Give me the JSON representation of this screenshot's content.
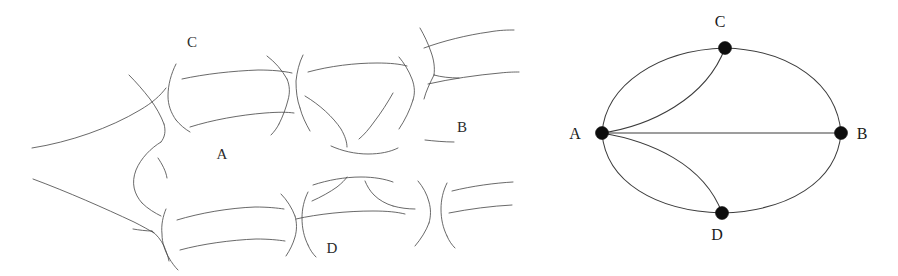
{
  "figure": {
    "background_color": "#ffffff",
    "ink_color": "#4a4a4a",
    "node_color": "#0d0d0d",
    "edge_color": "#3c3c3c"
  },
  "sketch_panel": {
    "name": "hand-drawn-map",
    "labels": [
      {
        "text": "C",
        "x": 192,
        "y": 47
      },
      {
        "text": "A",
        "x": 222,
        "y": 159
      },
      {
        "text": "B",
        "x": 462,
        "y": 132
      },
      {
        "text": "D",
        "x": 332,
        "y": 253
      }
    ]
  },
  "graph_panel": {
    "name": "planar-graph",
    "nodes": [
      {
        "id": "A",
        "cx": 82,
        "cy": 133,
        "r": 6.5,
        "label": "A",
        "label_x": 55,
        "label_y": 139
      },
      {
        "id": "B",
        "cx": 321,
        "cy": 133,
        "r": 6.5,
        "label": "B",
        "label_x": 342,
        "label_y": 139
      },
      {
        "id": "C",
        "cx": 205,
        "cy": 48,
        "r": 6.5,
        "label": "C",
        "label_x": 200,
        "label_y": 27
      },
      {
        "id": "D",
        "cx": 202,
        "cy": 213,
        "r": 6.5,
        "label": "D",
        "label_x": 197,
        "label_y": 240
      }
    ],
    "edges": [
      {
        "from": "A",
        "to": "C",
        "kind": "arc-outer-upper",
        "path": "M 82 133 C 86 84 139 50 205 48"
      },
      {
        "from": "C",
        "to": "B",
        "kind": "arc-outer-upper",
        "path": "M 205 48 C 271 50 317 84 321 133"
      },
      {
        "from": "B",
        "to": "D",
        "kind": "arc-outer-lower",
        "path": "M 321 133 C 317 182 268 211 202 213"
      },
      {
        "from": "D",
        "to": "A",
        "kind": "arc-outer-lower",
        "path": "M 202 213 C 136 211 86 182 82 133"
      },
      {
        "from": "A",
        "to": "B",
        "kind": "straight",
        "path": "M 82 133 L 321 133"
      },
      {
        "from": "A",
        "to": "C",
        "kind": "arc-inner-upper",
        "path": "M 82 133 C 130 126 186 99 205 48"
      },
      {
        "from": "A",
        "to": "D",
        "kind": "arc-inner-lower",
        "path": "M 82 133 C 130 141 184 164 202 213"
      }
    ],
    "node_count": 4,
    "edge_count": 7
  }
}
